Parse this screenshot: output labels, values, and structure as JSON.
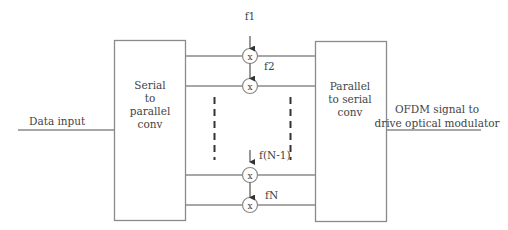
{
  "diagram": {
    "input_label": "Data input",
    "blocks": [
      {
        "id": "s2p",
        "lines": [
          "Serial",
          "to",
          "parallel",
          "conv"
        ]
      },
      {
        "id": "p2s",
        "lines": [
          "Parallel",
          "to serial",
          "conv"
        ]
      }
    ],
    "multiplier_symbol": "x",
    "subcarriers": [
      {
        "label": "f1"
      },
      {
        "label": "f2"
      },
      {
        "label": "f(N-1)"
      },
      {
        "label": "fN"
      }
    ],
    "output_label_lines": [
      "OFDM signal to",
      "drive optical modulator"
    ],
    "colors": {
      "stroke": "#8a8a8a",
      "text": "#444444",
      "dark": "#333333"
    }
  }
}
